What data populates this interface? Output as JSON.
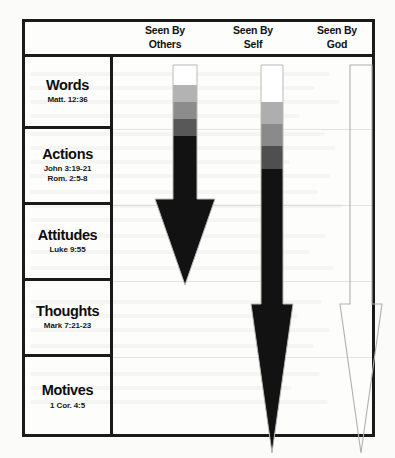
{
  "document": {
    "type": "accountability-chart",
    "background_color": "#fbfbfa",
    "frame_color": "#1a1a1a"
  },
  "header": {
    "columns": [
      {
        "id": "others",
        "line1": "Seen By",
        "line2": "Others"
      },
      {
        "id": "self",
        "line1": "Seen By",
        "line2": "Self"
      },
      {
        "id": "god",
        "line1": "Seen By",
        "line2": "God"
      }
    ]
  },
  "rows": [
    {
      "id": "words",
      "title": "Words",
      "reference_lines": [
        "Matt. 12:36"
      ]
    },
    {
      "id": "actions",
      "title": "Actions",
      "reference_lines": [
        "John 3:19-21",
        "Rom. 2:5-8"
      ]
    },
    {
      "id": "attitudes",
      "title": "Attitudes",
      "reference_lines": [
        "Luke 9:55"
      ]
    },
    {
      "id": "thoughts",
      "title": "Thoughts",
      "reference_lines": [
        "Mark 7:21-23"
      ]
    },
    {
      "id": "motives",
      "title": "Motives",
      "reference_lines": [
        "1 Cor. 4:5"
      ]
    }
  ],
  "arrows": [
    {
      "id": "seen-by-others-arrow",
      "column": "others",
      "style": "filled-gradient",
      "reaches_row": "attitudes",
      "outline_color": "#b9b9b9",
      "bands": [
        {
          "color": "#ffffff",
          "label": "none"
        },
        {
          "color": "#b3b3b3",
          "label": "light"
        },
        {
          "color": "#8c8c8c",
          "label": "medium"
        },
        {
          "color": "#585858",
          "label": "dark"
        },
        {
          "color": "#121212",
          "label": "full"
        }
      ]
    },
    {
      "id": "seen-by-self-arrow",
      "column": "self",
      "style": "filled-gradient",
      "reaches_row": "motives",
      "outline_color": "#b9b9b9",
      "bands": [
        {
          "color": "#ffffff",
          "label": "none"
        },
        {
          "color": "#aeaeae",
          "label": "light"
        },
        {
          "color": "#8a8a8a",
          "label": "medium"
        },
        {
          "color": "#4f4f4f",
          "label": "dark"
        },
        {
          "color": "#121212",
          "label": "full"
        }
      ]
    },
    {
      "id": "seen-by-god-arrow",
      "column": "god",
      "style": "outline-only",
      "reaches_row": "motives",
      "outline_color": "#b0b0b0",
      "fill_color": "none"
    }
  ],
  "chart_data": {
    "type": "bar",
    "categories": [
      "Words",
      "Actions",
      "Attitudes",
      "Thoughts",
      "Motives"
    ],
    "series": [
      {
        "name": "Seen By Others",
        "values": [
          1,
          1,
          1,
          0,
          0
        ]
      },
      {
        "name": "Seen By Self",
        "values": [
          1,
          1,
          1,
          1,
          1
        ]
      },
      {
        "name": "Seen By God",
        "values": [
          1,
          1,
          1,
          1,
          1
        ]
      }
    ],
    "xlabel": "",
    "ylabel": "",
    "legend_position": "top",
    "grid": true
  }
}
